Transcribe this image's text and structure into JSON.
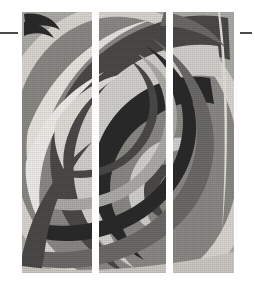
{
  "page": {
    "background_color": "#ffffff",
    "width": 255,
    "height": 289
  },
  "marks": {
    "left_tick_label": "",
    "right_tick_label": "",
    "color": "#4a4a4a"
  },
  "artwork": {
    "caption": "",
    "style": "grayscale halftone spiral",
    "panel_count": 3,
    "panels": [
      {
        "label": ""
      },
      {
        "label": ""
      },
      {
        "label": ""
      }
    ],
    "palette": {
      "white": "#f2f1ee",
      "light": "#d6d4d0",
      "mid_light": "#b0aeaa",
      "mid": "#8d8b88",
      "mid_dark": "#6e6c6a",
      "dark": "#4d4b4a",
      "darkest": "#2c2b2b"
    }
  }
}
